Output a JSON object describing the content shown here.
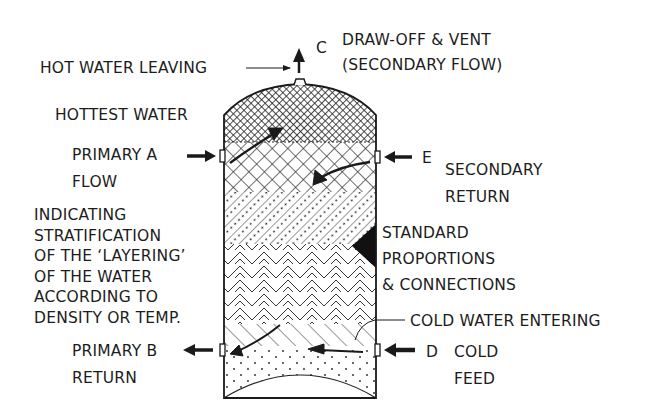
{
  "diagram": {
    "labels": {
      "hot_water_leaving": "HOT WATER LEAVING",
      "connection_c": "C",
      "draw_off_line1": "DRAW-OFF & VENT",
      "draw_off_line2": "(SECONDARY FLOW)",
      "hottest_water": "HOTTEST WATER",
      "primary_a_line1": "PRIMARY  A",
      "primary_a_line2": "FLOW",
      "connection_e": "E",
      "secondary_return_line1": "SECONDARY",
      "secondary_return_line2": "RETURN",
      "stratification": [
        "INDICATING",
        "STRATIFICATION",
        "OF THE ‘LAYERING’",
        "OF THE WATER",
        "ACCORDING TO",
        "DENSITY OR TEMP."
      ],
      "standard": [
        "STANDARD",
        "PROPORTIONS",
        "& CONNECTIONS"
      ],
      "cold_water_entering": "COLD WATER ENTERING",
      "primary_b_line1": "PRIMARY  B",
      "primary_b_line2": "RETURN",
      "connection_d": "D",
      "cold_feed_line1": "COLD",
      "cold_feed_line2": "FEED"
    },
    "layers": [
      {
        "name": "hottest",
        "pattern": "fine-crosshatch"
      },
      {
        "name": "hot",
        "pattern": "diamond-crosshatch"
      },
      {
        "name": "warm",
        "pattern": "dotted-diagonal"
      },
      {
        "name": "tepid",
        "pattern": "chevron"
      },
      {
        "name": "cool",
        "pattern": "diagonal"
      },
      {
        "name": "cold",
        "pattern": "dots"
      }
    ],
    "colors": {
      "ink": "#1a1a1a",
      "paper": "#ffffff"
    }
  }
}
